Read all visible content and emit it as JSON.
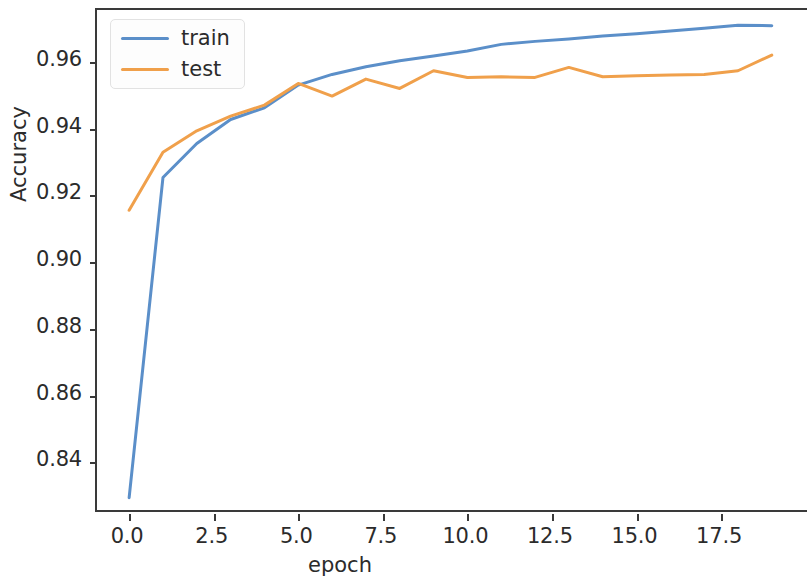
{
  "chart_data": {
    "type": "line",
    "title": "",
    "xlabel": "epoch",
    "ylabel": "Accuracy",
    "x": [
      0,
      1,
      2,
      3,
      4,
      5,
      6,
      7,
      8,
      9,
      10,
      11,
      12,
      13,
      14,
      15,
      16,
      17,
      18,
      19
    ],
    "series": [
      {
        "name": "train",
        "color": "#5b8fc9",
        "values": [
          0.8294,
          0.9253,
          0.9355,
          0.9427,
          0.9462,
          0.953,
          0.9562,
          0.9585,
          0.9603,
          0.9617,
          0.9632,
          0.9652,
          0.9661,
          0.9668,
          0.9677,
          0.9684,
          0.9692,
          0.97,
          0.9709,
          0.9708
        ]
      },
      {
        "name": "test",
        "color": "#f0a04b",
        "values": [
          0.9155,
          0.9329,
          0.9393,
          0.9437,
          0.947,
          0.9535,
          0.9497,
          0.9548,
          0.952,
          0.9573,
          0.9553,
          0.9555,
          0.9553,
          0.9583,
          0.9555,
          0.9558,
          0.956,
          0.9562,
          0.9573,
          0.962
        ]
      }
    ],
    "xlim": [
      -0.95,
      20.1
    ],
    "ylim": [
      0.8245,
      0.9755
    ],
    "xticks": [
      0.0,
      2.5,
      5.0,
      7.5,
      10.0,
      12.5,
      15.0,
      17.5
    ],
    "xticklabels": [
      "0.0",
      "2.5",
      "5.0",
      "7.5",
      "10.0",
      "12.5",
      "15.0",
      "17.5"
    ],
    "yticks": [
      0.84,
      0.86,
      0.88,
      0.9,
      0.92,
      0.94,
      0.96
    ],
    "yticklabels": [
      "0.84",
      "0.86",
      "0.88",
      "0.90",
      "0.92",
      "0.94",
      "0.96"
    ],
    "grid": false,
    "legend_position": "upper left",
    "legend_entries": [
      "train",
      "test"
    ]
  }
}
